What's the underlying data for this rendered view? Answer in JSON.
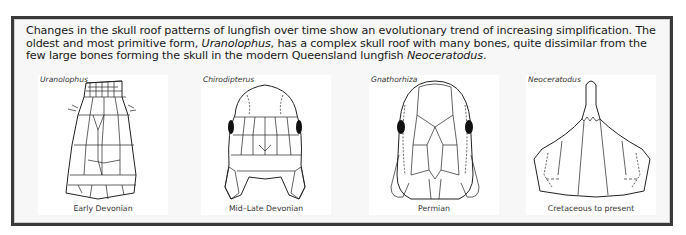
{
  "caption": {
    "part1": "Changes in the skull roof patterns of lungfish  over time show an evolutionary trend of increasing simplification. The oldest and most primitive form, ",
    "genus1": "Uranolophus",
    "part2": ", has a complex skull roof with many bones, quite dissimilar from the few large bones forming the skull in the modern Queensland lungfish ",
    "genus2": "Neoceratodus",
    "part3": "."
  },
  "panels": [
    {
      "genus": "Uranolophus",
      "period": "Early Devonian",
      "icon": "skull-roof-uranolophus-icon"
    },
    {
      "genus": "Chirodipterus",
      "period": "Mid–Late Devonian",
      "icon": "skull-roof-chirodipterus-icon"
    },
    {
      "genus": "Gnathorhiza",
      "period": "Permian",
      "icon": "skull-roof-gnathorhiza-icon"
    },
    {
      "genus": "Neoceratodus",
      "period": "Cretaceous to present",
      "icon": "skull-roof-neoceratodus-icon"
    }
  ],
  "colors": {
    "frame": "#3a3a3a",
    "background": "#f7f7f7",
    "ink": "#1a1a1a"
  }
}
